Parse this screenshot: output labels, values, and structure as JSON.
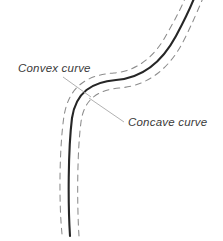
{
  "figure": {
    "background_color": "#ffffff"
  },
  "colors": {
    "center_line": "#262626",
    "edge_line": "#8c8c8c",
    "leader_line": "#a8a8a8",
    "label_text": "#3a3a3a"
  },
  "labels": [
    {
      "id": "convex",
      "text": "Convex curve",
      "x": 18,
      "y": 72,
      "leader_from": [
        63,
        77
      ],
      "leader_to": [
        91,
        97
      ]
    },
    {
      "id": "concave",
      "text": "Concave curve",
      "x": 128,
      "y": 126,
      "leader_from": [
        124,
        122
      ],
      "leader_to": [
        89,
        98
      ]
    }
  ],
  "chart_data": {
    "type": "line",
    "xlabel": "",
    "ylabel": "",
    "xlim": [
      0,
      223
    ],
    "ylim": [
      0,
      241
    ],
    "grid": false,
    "legend": "none",
    "annotations": [
      "Convex curve",
      "Concave curve"
    ],
    "series": [
      {
        "name": "centerline",
        "style": "solid",
        "color": "#262626",
        "width": 2.1,
        "path": "M 70 236 C 68 205, 68 150, 72 118 C 76 92, 92 82, 116 80 C 142 78, 162 62, 176 36 C 184 21, 190 9, 195 -4"
      },
      {
        "name": "left-edge-dashed",
        "style": "dashed",
        "color": "#8c8c8c",
        "width": 1.05,
        "dash": [
          6,
          5
        ],
        "path": "M 62 234 C 59 205, 59 150, 64 116 C 69 86, 87 75, 114 73 C 137 71, 155 57, 168 32 C 176 18, 182 6, 187 -6"
      },
      {
        "name": "right-edge-dashed",
        "style": "dashed",
        "color": "#8c8c8c",
        "width": 1.05,
        "dash": [
          6,
          5
        ],
        "path": "M 79 236 C 77 206, 77 152, 81 122 C 84 99, 98 90, 119 88 C 148 86, 170 68, 184 40 C 192 24, 198 10, 203 -2"
      }
    ]
  }
}
